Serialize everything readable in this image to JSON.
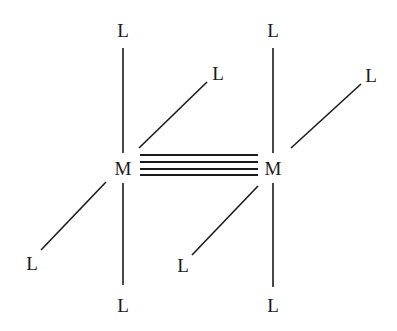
{
  "diagram": {
    "bond_order": 4,
    "metals": [
      {
        "id": "M1",
        "label": "M",
        "x": 123,
        "y": 168
      },
      {
        "id": "M2",
        "label": "M",
        "x": 273,
        "y": 168
      }
    ],
    "ligands": [
      {
        "id": "L1",
        "label": "L",
        "x": 123,
        "y": 30,
        "metal": "M1",
        "position": "top"
      },
      {
        "id": "L2",
        "label": "L",
        "x": 213,
        "y": 73,
        "metal": "M1",
        "position": "upper-right"
      },
      {
        "id": "L3",
        "label": "L",
        "x": 32,
        "y": 263,
        "metal": "M1",
        "position": "lower-left"
      },
      {
        "id": "L4",
        "label": "L",
        "x": 123,
        "y": 305,
        "metal": "M1",
        "position": "bottom"
      },
      {
        "id": "L5",
        "label": "L",
        "x": 273,
        "y": 30,
        "metal": "M2",
        "position": "top"
      },
      {
        "id": "L6",
        "label": "L",
        "x": 370,
        "y": 75,
        "metal": "M2",
        "position": "upper-right"
      },
      {
        "id": "L7",
        "label": "L",
        "x": 183,
        "y": 265,
        "metal": "M2",
        "position": "lower-left"
      },
      {
        "id": "L8",
        "label": "L",
        "x": 273,
        "y": 305,
        "metal": "M2",
        "position": "bottom"
      }
    ],
    "colors": {
      "ink": "#1a1a1a",
      "background": "#ffffff"
    }
  }
}
